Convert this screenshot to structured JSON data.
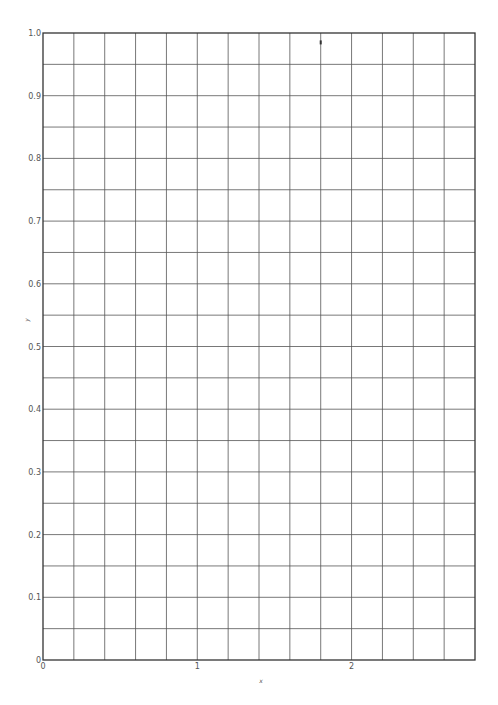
{
  "chart_data": {
    "type": "scatter",
    "title": "",
    "xlabel": "x",
    "ylabel": "y",
    "xlim": [
      0,
      2.8
    ],
    "ylim": [
      0,
      1.0
    ],
    "xticks": [
      0,
      1,
      2
    ],
    "xtick_labels": [
      "0",
      "1",
      "2"
    ],
    "yticks": [
      0,
      0.1,
      0.2,
      0.3,
      0.4,
      0.5,
      0.6,
      0.7,
      0.8,
      0.9,
      1.0
    ],
    "ytick_labels": [
      "0",
      "0.1",
      "0.2",
      "0.3",
      "0.4",
      "0.5",
      "0.6",
      "0.7",
      "0.8",
      "0.9",
      "1.0"
    ],
    "grid": true,
    "grid_minor_x_step": 0.2,
    "grid_minor_y_step": 0.05,
    "legend": null,
    "series": [
      {
        "name": "",
        "x": [
          1.8
        ],
        "y": [
          0.985
        ]
      }
    ]
  },
  "colors": {
    "frame": "#333333",
    "grid": "#555555",
    "text": "#555555",
    "marker": "#333333"
  }
}
